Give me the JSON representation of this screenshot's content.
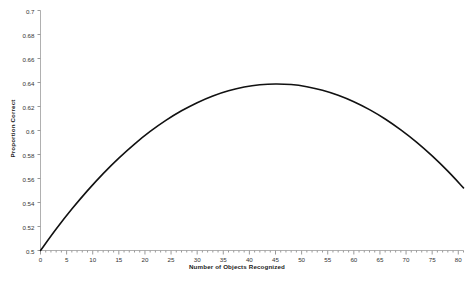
{
  "chart_data": {
    "type": "line",
    "title": "",
    "xlabel": "Number of Objects Recognized",
    "ylabel": "Proportion Correct",
    "xlim": [
      0,
      81
    ],
    "ylim": [
      0.5,
      0.7
    ],
    "grid": false,
    "legend": null,
    "xticks": [
      0,
      5,
      10,
      15,
      20,
      25,
      30,
      35,
      40,
      45,
      50,
      55,
      60,
      65,
      70,
      75,
      80
    ],
    "xtick_labels": [
      "0",
      "5",
      "10",
      "15",
      "20",
      "25",
      "30",
      "35",
      "40",
      "45",
      "50",
      "55",
      "60",
      "65",
      "70",
      "75",
      "80"
    ],
    "yticks": [
      0.5,
      0.52,
      0.54,
      0.56,
      0.58,
      0.6,
      0.62,
      0.64,
      0.66,
      0.68,
      0.7
    ],
    "ytick_labels": [
      "0.5",
      "0.52",
      "0.54",
      "0.56",
      "0.58",
      "0.6",
      "0.62",
      "0.64",
      "0.66",
      "0.68",
      "0.7"
    ],
    "minor_tick_interval": 1,
    "series": [
      {
        "name": "Proportion Correct",
        "color": "#111111",
        "line_width": 1.6,
        "x": [
          0,
          3,
          6,
          9,
          12,
          15,
          18,
          21,
          24,
          27,
          30,
          33,
          36,
          39,
          42,
          45,
          48,
          51,
          54,
          57,
          60,
          63,
          66,
          69,
          72,
          75,
          78,
          81
        ],
        "y": [
          0.5,
          0.5179,
          0.5345,
          0.5499,
          0.5641,
          0.577,
          0.5887,
          0.5992,
          0.6084,
          0.6164,
          0.6232,
          0.6288,
          0.6331,
          0.6362,
          0.6381,
          0.6388,
          0.6383,
          0.6365,
          0.6336,
          0.6294,
          0.624,
          0.6174,
          0.6096,
          0.6005,
          0.5903,
          0.5788,
          0.5661,
          0.5522
        ]
      }
    ],
    "peak": {
      "x": 46,
      "y": 0.6388
    },
    "start_point": {
      "x": 0,
      "y": 0.5
    },
    "end_point": {
      "x": 81,
      "y": 0.5522
    }
  },
  "axes": {
    "axis_color": "#b0b0b0",
    "tick_color": "#999999",
    "label_color": "#333333",
    "background": "#ffffff"
  }
}
